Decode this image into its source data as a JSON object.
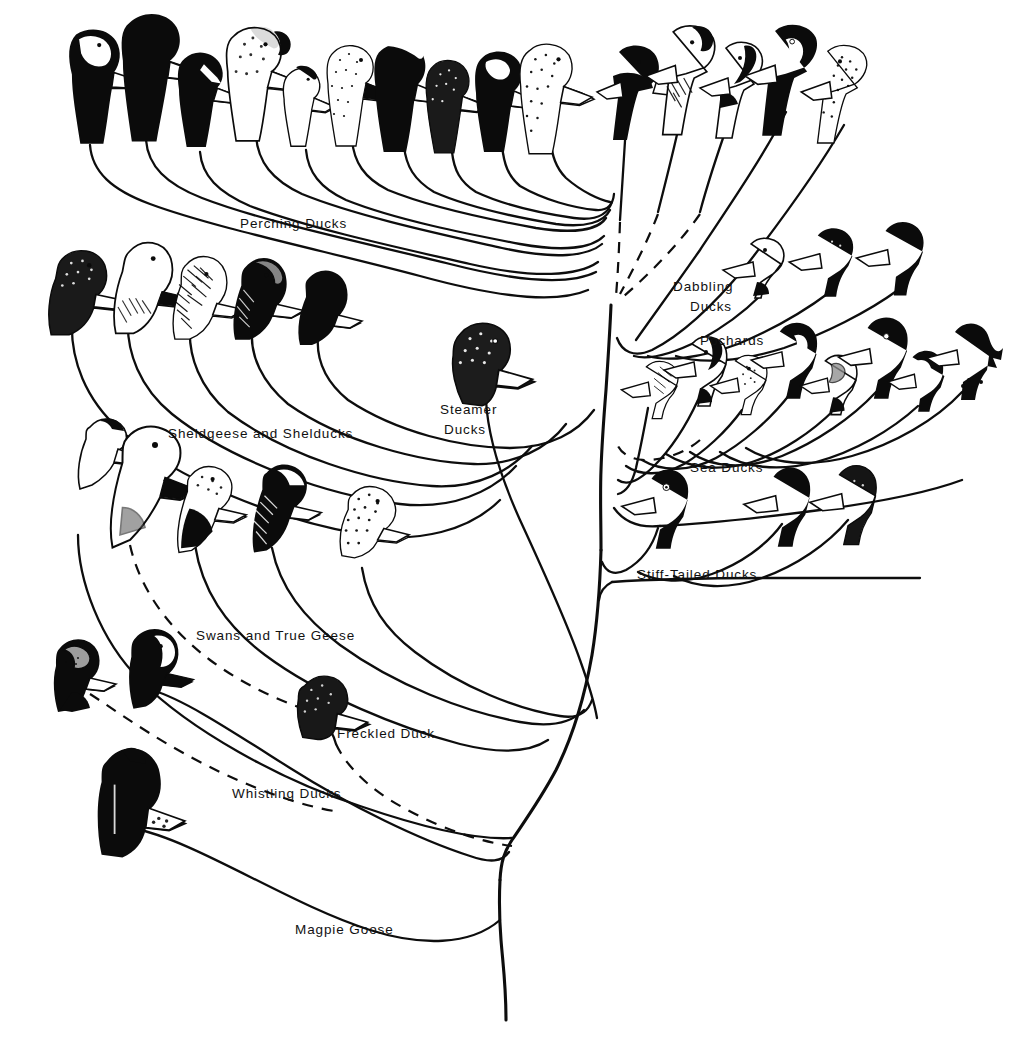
{
  "figure": {
    "type": "phylogenetic-tree",
    "title": "",
    "background_color": "#ffffff",
    "ink_color": "#0d0d0d",
    "orientation": "bottom-rooted, branches fan upward and outward",
    "root": {
      "label": "Magpie Goose",
      "note": "basal lineage at lower left; trunk continues to bottom of figure"
    }
  },
  "labels": [
    {
      "id": "perching-ducks",
      "text": "Perching Ducks",
      "x": 240,
      "y": 228,
      "lines": [
        "Perching Ducks"
      ]
    },
    {
      "id": "dabbling-ducks",
      "text": "Dabbling Ducks",
      "x": 673,
      "y": 291,
      "lines": [
        "Dabbling",
        "Ducks"
      ]
    },
    {
      "id": "pochards",
      "text": "Pochards",
      "x": 700,
      "y": 345,
      "lines": [
        "Pochards"
      ]
    },
    {
      "id": "sea-ducks",
      "text": "Sea Ducks",
      "x": 690,
      "y": 472,
      "lines": [
        "Sea Ducks"
      ]
    },
    {
      "id": "stiff-tailed-ducks",
      "text": "Stiff-Tailed Ducks",
      "x": 637,
      "y": 579,
      "lines": [
        "Stiff-Tailed Ducks"
      ]
    },
    {
      "id": "steamer-ducks",
      "text": "Steamer Ducks",
      "x": 440,
      "y": 414,
      "lines": [
        "Steamer",
        "Ducks"
      ]
    },
    {
      "id": "sheldgeese-shelducks",
      "text": "Sheldgeese and Shelducks",
      "x": 168,
      "y": 438,
      "lines": [
        "Sheldgeese and Shelducks"
      ]
    },
    {
      "id": "swans-true-geese",
      "text": "Swans and True Geese",
      "x": 196,
      "y": 640,
      "lines": [
        "Swans and True Geese"
      ]
    },
    {
      "id": "freckled-duck",
      "text": "Freckled Duck",
      "x": 337,
      "y": 738,
      "lines": [
        "Freckled Duck"
      ]
    },
    {
      "id": "whistling-ducks",
      "text": "Whistling Ducks",
      "x": 232,
      "y": 798,
      "lines": [
        "Whistling Ducks"
      ]
    },
    {
      "id": "magpie-goose",
      "text": "Magpie Goose",
      "x": 295,
      "y": 934,
      "lines": [
        "Magpie Goose"
      ]
    }
  ],
  "groups": [
    {
      "id": "perching-ducks",
      "label": "Perching Ducks",
      "tip_count": 10,
      "tips": [
        {
          "i": 0,
          "x": 95,
          "y": 85,
          "plumage": "dark head, pale speckled crown, white foreneck"
        },
        {
          "i": 1,
          "x": 152,
          "y": 72,
          "plumage": "all dark head, pale bill patch"
        },
        {
          "i": 2,
          "x": 202,
          "y": 97,
          "plumage": "dark head with white facial stripe"
        },
        {
          "i": 3,
          "x": 255,
          "y": 80,
          "plumage": "pale speckled head, dark crown cap"
        },
        {
          "i": 4,
          "x": 303,
          "y": 105,
          "plumage": "small pale head, dark crown"
        },
        {
          "i": 5,
          "x": 352,
          "y": 92,
          "plumage": "speckled pale head"
        },
        {
          "i": 6,
          "x": 402,
          "y": 95,
          "plumage": "dark head, white crest stripe"
        },
        {
          "i": 7,
          "x": 450,
          "y": 105,
          "plumage": "mottled dark head"
        },
        {
          "i": 8,
          "x": 500,
          "y": 100,
          "plumage": "dark head with white face crescent"
        },
        {
          "i": 9,
          "x": 548,
          "y": 95,
          "plumage": "dark mottled head"
        }
      ]
    },
    {
      "id": "dabbling-ducks",
      "label": "Dabbling Ducks",
      "tip_count": 8,
      "tips": [
        {
          "i": 0,
          "x": 637,
          "y": 92,
          "plumage": "dark glossy head"
        },
        {
          "i": 1,
          "x": 690,
          "y": 78,
          "plumage": "white head with dark crown patch"
        },
        {
          "i": 2,
          "x": 740,
          "y": 88,
          "plumage": "white head, dark stripe through crown"
        },
        {
          "i": 3,
          "x": 790,
          "y": 78,
          "plumage": "white face, bold dark crescent"
        },
        {
          "i": 4,
          "x": 842,
          "y": 92,
          "plumage": "speckled brown head"
        },
        {
          "i": 5,
          "x": 763,
          "y": 268,
          "plumage": "white head, long pale bill"
        },
        {
          "i": 6,
          "x": 830,
          "y": 262,
          "plumage": "dark head, speckled cheek"
        },
        {
          "i": 7,
          "x": 898,
          "y": 258,
          "plumage": "black glossy head"
        }
      ],
      "dashed_branches": 3
    },
    {
      "id": "pochards",
      "label": "Pochards",
      "tip_count": 8,
      "tips": [
        {
          "i": 0,
          "x": 656,
          "y": 386,
          "plumage": "pale head with mottled cheek"
        },
        {
          "i": 1,
          "x": 702,
          "y": 368,
          "plumage": "white head with dark crown and nape"
        },
        {
          "i": 2,
          "x": 745,
          "y": 382,
          "plumage": "pale speckled head"
        },
        {
          "i": 3,
          "x": 790,
          "y": 358,
          "plumage": "black head with white facial crescent"
        },
        {
          "i": 4,
          "x": 835,
          "y": 382,
          "plumage": "pale face, dark eye-line"
        },
        {
          "i": 5,
          "x": 878,
          "y": 355,
          "plumage": "black head, white eye"
        },
        {
          "i": 6,
          "x": 920,
          "y": 378,
          "plumage": "rounded black head"
        },
        {
          "i": 7,
          "x": 963,
          "y": 358,
          "plumage": "black head with shaggy crest"
        }
      ],
      "dashed_branches": 1
    },
    {
      "id": "sea-ducks",
      "label": "Sea Ducks",
      "tip_count": 3,
      "tips": [
        {
          "i": 0,
          "x": 660,
          "y": 502,
          "plumage": "black head, white eye patch"
        },
        {
          "i": 1,
          "x": 782,
          "y": 500,
          "plumage": "black head, pale bill"
        },
        {
          "i": 2,
          "x": 848,
          "y": 498,
          "plumage": "dark speckled head"
        }
      ]
    },
    {
      "id": "stiff-tailed-ducks",
      "label": "Stiff-Tailed Ducks",
      "tip_count": 0,
      "tips": []
    },
    {
      "id": "steamer-ducks",
      "label": "Steamer Ducks",
      "tip_count": 1,
      "tips": [
        {
          "i": 0,
          "x": 482,
          "y": 365,
          "plumage": "grey speckled head, pale bill"
        }
      ]
    },
    {
      "id": "sheldgeese-shelducks",
      "label": "Sheldgeese and Shelducks",
      "tip_count": 5,
      "tips": [
        {
          "i": 0,
          "x": 78,
          "y": 290,
          "plumage": "dark speckled head, pale bill"
        },
        {
          "i": 1,
          "x": 140,
          "y": 285,
          "plumage": "white head, dark bill"
        },
        {
          "i": 2,
          "x": 198,
          "y": 295,
          "plumage": "dark hatched head, pale bill"
        },
        {
          "i": 3,
          "x": 258,
          "y": 296,
          "plumage": "dark head with paler crown"
        },
        {
          "i": 4,
          "x": 320,
          "y": 305,
          "plumage": "solid black head, pale bill"
        }
      ]
    },
    {
      "id": "swans-true-geese",
      "label": "Swans and True Geese",
      "tip_count": 5,
      "tips": [
        {
          "i": 0,
          "x": 98,
          "y": 445,
          "plumage": "white head with dark knob"
        },
        {
          "i": 1,
          "x": 135,
          "y": 470,
          "plumage": "white swan head, dark bill"
        },
        {
          "i": 2,
          "x": 200,
          "y": 500,
          "plumage": "speckled head, dark neck"
        },
        {
          "i": 3,
          "x": 275,
          "y": 500,
          "plumage": "white cheek, dark hatched neck"
        },
        {
          "i": 4,
          "x": 365,
          "y": 520,
          "plumage": "speckled goose head, pale bill"
        }
      ],
      "dashed_branches": 1
    },
    {
      "id": "freckled-duck",
      "label": "Freckled Duck",
      "tip_count": 1,
      "tips": [
        {
          "i": 0,
          "x": 320,
          "y": 705,
          "plumage": "dark freckled head, pale bill"
        }
      ],
      "dashed_branches": 1
    },
    {
      "id": "whistling-ducks",
      "label": "Whistling Ducks",
      "tip_count": 2,
      "tips": [
        {
          "i": 0,
          "x": 72,
          "y": 672,
          "plumage": "dark head, pale speckled crown"
        },
        {
          "i": 1,
          "x": 148,
          "y": 665,
          "plumage": "dark head with white face patch"
        }
      ],
      "dashed_branches": 1
    },
    {
      "id": "magpie-goose",
      "label": "Magpie Goose",
      "tip_count": 1,
      "tips": [
        {
          "i": 0,
          "x": 125,
          "y": 795,
          "plumage": "black head, knobbed crown, pale bill tip"
        }
      ]
    }
  ],
  "legend": {
    "present": false
  },
  "axes": {
    "present": false
  }
}
